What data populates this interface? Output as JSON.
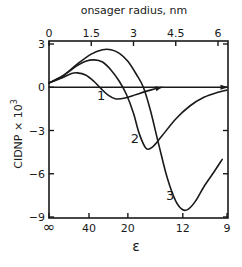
{
  "chart_data": {
    "type": "line",
    "title": "",
    "xlabel": "ε",
    "x2label": "onsager radius, nm",
    "ylabel": "CIDNP × 10",
    "ylabel_exp": "3",
    "xlim": [
      0,
      6.35
    ],
    "ylim": [
      -9,
      3
    ],
    "grid": false,
    "top_ticks": [
      {
        "value": 0,
        "label": "0"
      },
      {
        "value": 1.5,
        "label": "1.5"
      },
      {
        "value": 3,
        "label": "3"
      },
      {
        "value": 4.5,
        "label": "4.5"
      },
      {
        "value": 6,
        "label": "6"
      }
    ],
    "bottom_ticks": [
      {
        "value": 0,
        "label": "∞"
      },
      {
        "value": 1.42,
        "label": "40"
      },
      {
        "value": 2.8,
        "label": "20"
      },
      {
        "value": 4.75,
        "label": "12"
      },
      {
        "value": 6.32,
        "label": "9"
      }
    ],
    "y_ticks": [
      {
        "value": 3,
        "label": "3"
      },
      {
        "value": 0,
        "label": "0"
      },
      {
        "value": -3,
        "label": "−3"
      },
      {
        "value": -6,
        "label": "−6"
      },
      {
        "value": -9,
        "label": "−9"
      }
    ],
    "zero_line": {
      "y": 0,
      "x_end": 6.3,
      "arrow": true
    },
    "series": [
      {
        "name": "1",
        "label_at": [
          1.85,
          -0.85
        ],
        "arrow_end": true,
        "x": [
          0,
          0.4,
          0.8,
          1.0,
          1.3,
          1.6,
          1.85,
          2.1,
          2.35,
          2.7,
          3.1,
          3.6,
          4.0
        ],
        "y": [
          0.3,
          0.6,
          0.95,
          1.0,
          0.85,
          0.4,
          -0.1,
          -0.55,
          -0.8,
          -0.75,
          -0.5,
          -0.2,
          0.0
        ]
      },
      {
        "name": "2",
        "label_at": [
          3.05,
          -3.9
        ],
        "arrow_end": false,
        "x": [
          0,
          0.5,
          1.0,
          1.3,
          1.6,
          1.9,
          2.2,
          2.5,
          2.75,
          3.0,
          3.2,
          3.45,
          3.7,
          4.0,
          4.5,
          5.0,
          5.5,
          6.0,
          6.3
        ],
        "y": [
          0.3,
          0.8,
          1.5,
          1.8,
          1.9,
          1.75,
          1.2,
          0.4,
          -0.5,
          -1.8,
          -3.2,
          -4.25,
          -4.1,
          -3.4,
          -2.2,
          -1.3,
          -0.7,
          -0.35,
          -0.2
        ]
      },
      {
        "name": "3",
        "label_at": [
          4.3,
          -7.8
        ],
        "arrow_end": false,
        "x": [
          0,
          0.5,
          1.0,
          1.5,
          1.9,
          2.2,
          2.5,
          2.8,
          3.1,
          3.35,
          3.6,
          3.9,
          4.2,
          4.5,
          4.75,
          4.95,
          5.2,
          5.5,
          5.85,
          6.15
        ],
        "y": [
          0.3,
          0.8,
          1.6,
          2.3,
          2.6,
          2.6,
          2.35,
          1.8,
          0.9,
          0.0,
          -1.6,
          -4.0,
          -6.3,
          -7.9,
          -8.5,
          -8.45,
          -7.9,
          -6.9,
          -5.9,
          -5.0
        ]
      }
    ]
  }
}
